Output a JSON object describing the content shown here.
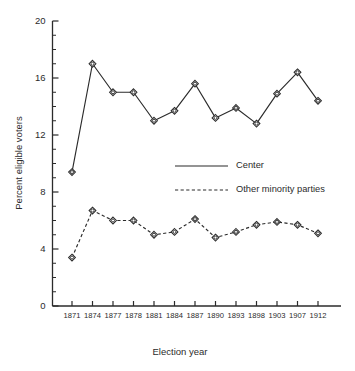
{
  "chart_data": {
    "type": "line",
    "title": "",
    "xlabel": "Election year",
    "ylabel": "Percent eligible voters",
    "categories": [
      "1871",
      "1874",
      "1877",
      "1878",
      "1881",
      "1884",
      "1887",
      "1890",
      "1893",
      "1898",
      "1903",
      "1907",
      "1912"
    ],
    "series": [
      {
        "name": "Center",
        "style": "solid",
        "marker": "diamond-dot",
        "values": [
          9.4,
          17.0,
          15.0,
          15.0,
          13.0,
          13.7,
          15.6,
          13.2,
          13.9,
          12.8,
          14.9,
          16.4,
          14.4
        ]
      },
      {
        "name": "Other minority parties",
        "style": "dashed",
        "marker": "diamond-dot",
        "values": [
          3.4,
          6.7,
          6.0,
          6.0,
          5.0,
          5.2,
          6.1,
          4.8,
          5.2,
          5.7,
          5.9,
          5.7,
          5.1
        ]
      }
    ],
    "ylim": [
      0,
      20
    ],
    "yticks": [
      0,
      4,
      8,
      12,
      16,
      20
    ],
    "ytick_labels": [
      "0",
      "4",
      "8",
      "12",
      "16",
      "20"
    ],
    "y_minor_tick_step": 1,
    "grid": false,
    "legend_position": "center-right-inside",
    "line_color": "#2b2b2b",
    "background_color": "#ffffff"
  },
  "legend": {
    "entries": [
      {
        "label": "Center"
      },
      {
        "label": "Other minority parties"
      }
    ]
  }
}
